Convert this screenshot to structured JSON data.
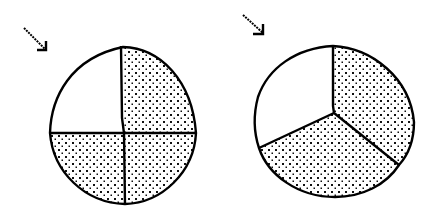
{
  "figures": [
    {
      "label": "circle divided into four equal parts, three shaded",
      "parts_total": 4,
      "parts_shaded": 3,
      "shaded_fraction": "3/4",
      "arrow": {
        "from": [
          24,
          28
        ],
        "to": [
          46,
          50
        ]
      },
      "circle": {
        "cx": 123,
        "cy": 126,
        "r": 74
      },
      "center": [
        123,
        133
      ],
      "dividers": [
        [
          123,
          47
        ],
        [
          196,
          133
        ],
        [
          125,
          204
        ],
        [
          50,
          133
        ]
      ],
      "shaded_sectors": [
        "upper-right",
        "lower-right",
        "lower-left"
      ],
      "unshaded_sectors": [
        "upper-left"
      ]
    },
    {
      "label": "circle divided into three parts, two shaded",
      "parts_total": 3,
      "parts_shaded": 2,
      "shaded_fraction": "2/3",
      "arrow": {
        "from": [
          243,
          15
        ],
        "to": [
          264,
          34
        ]
      },
      "circle": {
        "cx": 335,
        "cy": 122,
        "r": 78
      },
      "center": [
        334,
        113
      ],
      "dividers": [
        [
          333,
          46
        ],
        [
          399,
          165
        ],
        [
          259,
          148
        ]
      ],
      "shaded_sectors": [
        "right",
        "bottom"
      ],
      "unshaded_sectors": [
        "upper-left"
      ]
    }
  ],
  "colors": {
    "stroke": "#000000",
    "shade_dot": "#111111",
    "background": "#ffffff"
  }
}
